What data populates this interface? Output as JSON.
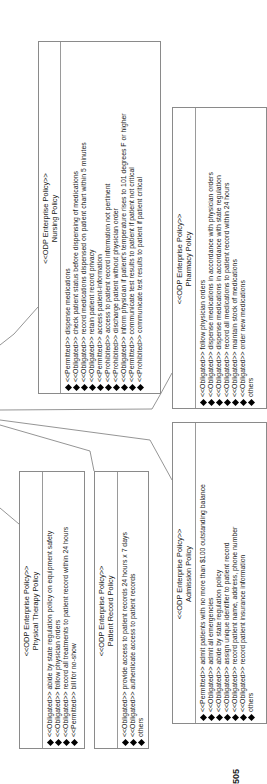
{
  "diagram": {
    "figure_label": "505",
    "boxes": {
      "nursing": {
        "stereotype": "<<ODP Enterprise Policy>>",
        "name": "Nursing Policy",
        "items": [
          "<<Permitted>> dispense medications",
          "<<Obligated>> check patient status before dispensing of medications",
          "<<Obligated>> record medications dispensed on patient chart within 5 minutes",
          "<<Obligated>> retain patient record privacy",
          "<<Permitted>> access patient-information",
          "<<Prohibited>> access to patient record information not pertinent",
          "<<Prohibited>> discharge patient without physician order",
          "<<Obligated>> inform physician if patient's temperature rises to 101 degrees F or higher",
          "<<Permitted>> communicate test results to patient if patient not critical",
          "<<Prohibited>> communicate test results to patient if patient critical"
        ]
      },
      "pharmacy": {
        "stereotype": "<<ODP Enterprise Policy>>",
        "name": "Pharmacy Policy",
        "items": [
          "<<Obligated>> follow physician orders",
          "<<Obligated>> dispense medications in accordance with physician orders",
          "<<Obligated>> dispense medications in accordance with state regulation",
          "<<Obligated>> record all medications to patient record within 24 hours",
          "<<Obligated>> maintain stock of medications",
          "<<Obligated>> order new medications",
          "others"
        ]
      },
      "physical_therapy": {
        "stereotype": "<<ODP Enterprise Policy>>",
        "name": "Physical Therapy Policy",
        "items": [
          "<<Obligated>> abide by state regulation policy on equipment safety",
          "<<Obligated>> follow physician orders",
          "<<Obligated>> record all treatments to patient record within 24 hours",
          "<<Permitted>> bill for no-show"
        ]
      },
      "patient_record": {
        "stereotype": "<<ODP Enterprise Policy>>",
        "name": "Patient Record Policy",
        "items": [
          "<<Obligated>> provide access to patient records 24 hours x 7 days",
          "<<Obligated>> authenticate access to patient records",
          "others"
        ]
      },
      "admission": {
        "stereotype": "<<ODP Enterprise Policy>>",
        "name": "Admission Policy",
        "items": [
          "<<Permitted>> admit patients with no more than $100 outstanding balance",
          "<<Obligated>> admit all emergencies",
          "<<Obligated>> abide by state regulation policy",
          "<<Obligated>> assign unique identifier to patient record",
          "<<Obligated>> record patient name, address, phone number",
          "<<Obligated>> record patient insurance information",
          "others"
        ]
      }
    },
    "colors": {
      "border": "#8a8a8a",
      "text": "#1a1a1a",
      "diamond": "#000000",
      "connector": "#7a7a7a"
    }
  }
}
